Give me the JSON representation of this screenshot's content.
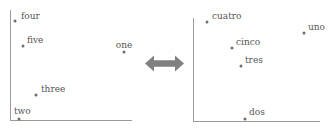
{
  "figure": {
    "width": 332,
    "height": 131,
    "background_color": "#ffffff",
    "point_color": "#6e6e6e",
    "label_color": "#555555",
    "axis_color": "#9a9a9a",
    "arrow_color": "#808080"
  },
  "connector": {
    "icon": "double-headed-arrow-icon",
    "direction": "bidirectional",
    "color": "#808080",
    "x": 145,
    "y": 54,
    "width": 39,
    "height": 19
  },
  "chart_data": [
    {
      "type": "scatter",
      "name": "english-numbers",
      "title": "",
      "xlabel": "",
      "ylabel": "",
      "grid": false,
      "legend": false,
      "axes": {
        "x0": 10,
        "y0": 120,
        "x1": 132,
        "y1": 10
      },
      "points": [
        {
          "label": "four",
          "x": 15,
          "y": 21,
          "label_dx": 6,
          "label_dy": -10,
          "label_align": "left"
        },
        {
          "label": "five",
          "x": 23,
          "y": 46,
          "label_dx": 4,
          "label_dy": -11,
          "label_align": "left"
        },
        {
          "label": "one",
          "x": 124,
          "y": 52,
          "label_dx": 0,
          "label_dy": -12,
          "label_align": "center"
        },
        {
          "label": "three",
          "x": 36,
          "y": 95,
          "label_dx": 5,
          "label_dy": -11,
          "label_align": "left"
        },
        {
          "label": "two",
          "x": 19,
          "y": 119,
          "label_dx": -5,
          "label_dy": -13,
          "label_align": "left"
        }
      ]
    },
    {
      "type": "scatter",
      "name": "spanish-numbers",
      "title": "",
      "xlabel": "",
      "ylabel": "",
      "grid": false,
      "legend": false,
      "axes": {
        "x0": 193,
        "y0": 121,
        "x1": 320,
        "y1": 18
      },
      "points": [
        {
          "label": "cuatro",
          "x": 207,
          "y": 22,
          "label_dx": 5,
          "label_dy": -11,
          "label_align": "left"
        },
        {
          "label": "uno",
          "x": 304,
          "y": 33,
          "label_dx": 4,
          "label_dy": -11,
          "label_align": "left"
        },
        {
          "label": "cinco",
          "x": 232,
          "y": 48,
          "label_dx": 4,
          "label_dy": -11,
          "label_align": "left"
        },
        {
          "label": "tres",
          "x": 241,
          "y": 66,
          "label_dx": 4,
          "label_dy": -11,
          "label_align": "left"
        },
        {
          "label": "dos",
          "x": 245,
          "y": 119,
          "label_dx": 4,
          "label_dy": -12,
          "label_align": "left"
        }
      ]
    }
  ]
}
